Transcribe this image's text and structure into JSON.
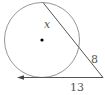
{
  "diagram": {
    "type": "circle-secant-tangent",
    "labels": {
      "secant_internal": "x",
      "secant_external": "8",
      "tangent": "13"
    },
    "colors": {
      "stroke": "#666666",
      "text": "#555555",
      "center_dot": "#000000",
      "background": "#ffffff"
    }
  }
}
